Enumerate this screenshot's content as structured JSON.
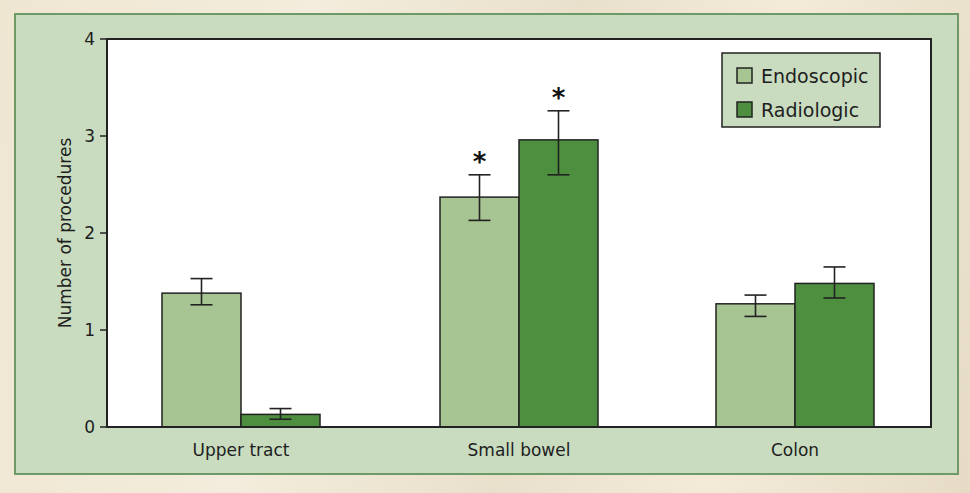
{
  "colors": {
    "panel_bg": "#c9dcc0",
    "panel_border": "#6e9a68",
    "plot_bg": "#ffffff",
    "endoscopic": "#a7c493",
    "radiologic": "#4d8e3f",
    "axis": "#222222"
  },
  "chart_data": {
    "type": "bar",
    "title": "",
    "xlabel": "",
    "ylabel": "Number of procedures",
    "ylim": [
      0,
      4
    ],
    "yticks": [
      0,
      1,
      2,
      3,
      4
    ],
    "ytick_labels": [
      "0",
      "1",
      "2",
      "3",
      "4"
    ],
    "grid": false,
    "legend_position": "top-right",
    "categories": [
      "Upper tract",
      "Small bowel",
      "Colon"
    ],
    "series": [
      {
        "name": "Endoscopic",
        "color": "#a7c493",
        "values": [
          1.38,
          2.37,
          1.27
        ],
        "error_low": [
          1.26,
          2.13,
          1.14
        ],
        "error_high": [
          1.53,
          2.6,
          1.36
        ],
        "significant": [
          false,
          true,
          false
        ]
      },
      {
        "name": "Radiologic",
        "color": "#4d8e3f",
        "values": [
          0.13,
          2.96,
          1.48
        ],
        "error_low": [
          0.08,
          2.6,
          1.33
        ],
        "error_high": [
          0.19,
          3.26,
          1.65
        ],
        "significant": [
          false,
          true,
          false
        ]
      }
    ],
    "annotations": [
      {
        "text": "*",
        "category": "Small bowel",
        "series": "Endoscopic"
      },
      {
        "text": "*",
        "category": "Small bowel",
        "series": "Radiologic"
      }
    ]
  },
  "legend": {
    "items": [
      {
        "label": "Endoscopic"
      },
      {
        "label": "Radiologic"
      }
    ]
  }
}
